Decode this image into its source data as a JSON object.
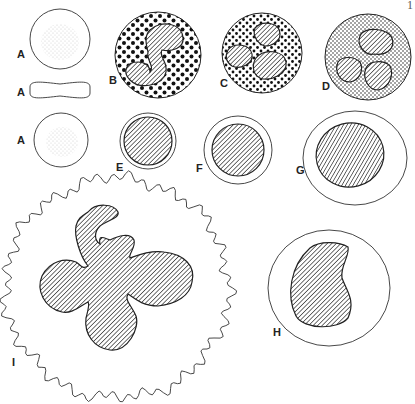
{
  "figure": {
    "page_mark": "1",
    "cells": [
      {
        "id": "A1",
        "label": "A",
        "description": "erythrocyte, face view"
      },
      {
        "id": "A2",
        "label": "A",
        "description": "erythrocyte, side view"
      },
      {
        "id": "A3",
        "label": "A",
        "description": "erythrocyte, face view (small)"
      },
      {
        "id": "B",
        "label": "B",
        "description": "granulocyte with coarse dark granules, lobed nucleus"
      },
      {
        "id": "C",
        "label": "C",
        "description": "granulocyte with dark granules, multilobed nucleus"
      },
      {
        "id": "D",
        "label": "D",
        "description": "granulocyte with fine granules, multilobed nucleus"
      },
      {
        "id": "E",
        "label": "E",
        "description": "small lymphocyte"
      },
      {
        "id": "F",
        "label": "F",
        "description": "lymphocyte"
      },
      {
        "id": "G",
        "label": "G",
        "description": "large lymphocyte"
      },
      {
        "id": "H",
        "label": "H",
        "description": "monocyte with kidney-shaped nucleus"
      },
      {
        "id": "I",
        "label": "I",
        "description": "megakaryocyte with lobed nucleus"
      }
    ]
  }
}
